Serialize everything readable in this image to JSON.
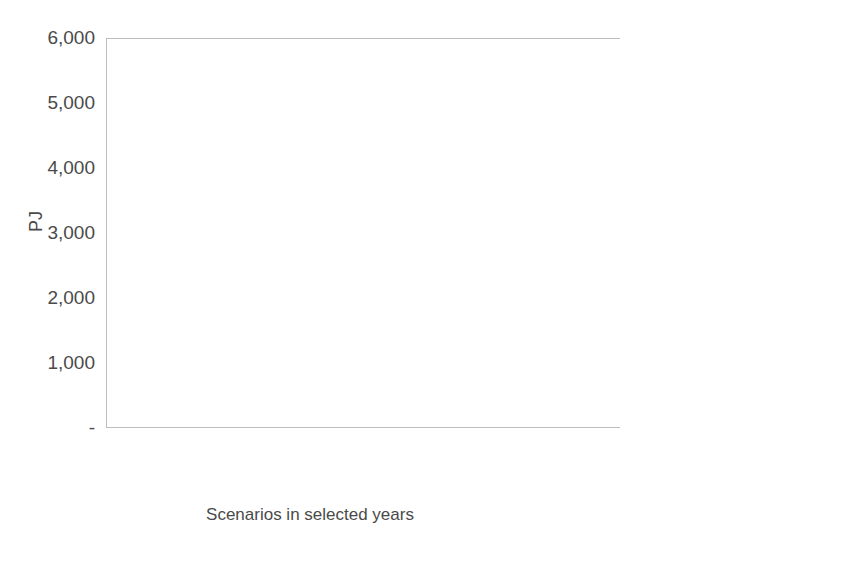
{
  "chart_data": {
    "type": "bar",
    "subtype": "stacked-vertical",
    "title": "",
    "xlabel": "Scenarios in selected years",
    "ylabel": "PJ",
    "ylim": [
      0,
      6000
    ],
    "ytick_values": [
      0,
      1000,
      2000,
      3000,
      4000,
      5000,
      6000
    ],
    "ytick_labels": [
      "-",
      "1,000",
      "2,000",
      "3,000",
      "4,000",
      "5,000",
      "6,000"
    ],
    "grid": false,
    "legend_position": "right",
    "categories": [
      "35-LC",
      "35-LC-EA",
      "35-LC-LC",
      "35-LC-SO",
      "50-LC",
      "50-LC-EA",
      "50-LC-LC",
      "50-LC-SO"
    ],
    "stack_order_bottom_to_top": [
      "Electricity",
      "Fuel oil",
      "LPG",
      "Gas",
      "Coal",
      "Petrol",
      "Diesel",
      "Jet fuel",
      "Hydrogen",
      "Ethanol/Methanol",
      "Bio diesels",
      "Manufactured fuel",
      "Biomass",
      "Heat",
      "Others"
    ],
    "series": [
      {
        "name": "Electricity",
        "values": [
          1240,
          1300,
          1260,
          1250,
          1610,
          1610,
          1820,
          1470
        ]
      },
      {
        "name": "Fuel oil",
        "values": [
          50,
          45,
          50,
          50,
          45,
          45,
          45,
          45
        ]
      },
      {
        "name": "LPG",
        "values": [
          15,
          15,
          15,
          15,
          15,
          15,
          15,
          15
        ]
      },
      {
        "name": "Gas",
        "values": [
          2200,
          1930,
          2000,
          2180,
          1200,
          1220,
          900,
          1400
        ]
      },
      {
        "name": "Coal",
        "values": [
          30,
          25,
          30,
          30,
          30,
          30,
          30,
          30
        ]
      },
      {
        "name": "Petrol",
        "values": [
          740,
          630,
          890,
          620,
          400,
          400,
          330,
          500
        ]
      },
      {
        "name": "Jet fuel",
        "values": [
          35,
          40,
          35,
          30,
          40,
          40,
          40,
          35
        ]
      },
      {
        "name": "Diesel",
        "values": [
          790,
          680,
          810,
          330,
          40,
          40,
          40,
          260
        ]
      },
      {
        "name": "Hydrogen",
        "values": [
          0,
          0,
          0,
          290,
          210,
          200,
          230,
          350
        ]
      },
      {
        "name": "Ethanol/Methanol",
        "values": [
          220,
          380,
          190,
          0,
          400,
          400,
          560,
          0
        ]
      },
      {
        "name": "Bio diesels",
        "values": [
          45,
          300,
          60,
          35,
          350,
          330,
          280,
          55
        ]
      },
      {
        "name": "Manufactured fuel",
        "values": [
          0,
          0,
          0,
          0,
          0,
          0,
          0,
          0
        ]
      },
      {
        "name": "Biomass",
        "values": [
          190,
          120,
          190,
          130,
          110,
          110,
          290,
          170
        ]
      },
      {
        "name": "Heat",
        "values": [
          20,
          20,
          20,
          20,
          20,
          20,
          20,
          20
        ]
      },
      {
        "name": "Others",
        "values": [
          10,
          10,
          10,
          10,
          10,
          10,
          10,
          10
        ]
      }
    ],
    "totals": [
      5585,
      5268,
      5525,
      4890,
      4370,
      4340,
      4380,
      4280
    ]
  },
  "axes": {
    "y_title": "PJ",
    "x_title": "Scenarios in selected years",
    "y_ticks": [
      "6,000",
      "5,000",
      "4,000",
      "3,000",
      "2,000",
      "1,000",
      "-"
    ],
    "x_ticks": [
      "35-LC",
      "35-LC-EA",
      "35-LC-LC",
      "35-LC-SO",
      "50-LC",
      "50-LC-EA",
      "50-LC-LC",
      "50-LC-SO"
    ]
  },
  "legend": {
    "items": [
      {
        "label": "Others",
        "pattern": "checker-light",
        "color": "#d9d9d9"
      },
      {
        "label": "Heat",
        "pattern": "solid-mid-grid",
        "color": "#a6a6a6"
      },
      {
        "label": "Biomass",
        "pattern": "brick",
        "color": "#e8e8e8"
      },
      {
        "label": "Manufactured fuel",
        "pattern": "plain-white",
        "color": "#ffffff"
      },
      {
        "label": "Bio diesels",
        "pattern": "horizontal",
        "color": "#ffffff"
      },
      {
        "label": "Ethanol/Methanol",
        "pattern": "plain-white",
        "color": "#ffffff"
      },
      {
        "label": "Hydrogen",
        "pattern": "vertical",
        "color": "#ffffff"
      },
      {
        "label": "Jet fuel",
        "pattern": "solid-black",
        "color": "#1a1a1a"
      },
      {
        "label": "Diesel",
        "pattern": "diagonal-down",
        "color": "#ffffff"
      },
      {
        "label": "Petrol",
        "pattern": "noise-light",
        "color": "#e4e4e4"
      },
      {
        "label": "Coal",
        "pattern": "speckle-pale",
        "color": "#efefef"
      },
      {
        "label": "Gas",
        "pattern": "noise-mid",
        "color": "#9d9d9d"
      },
      {
        "label": "LPG",
        "pattern": "cross-light",
        "color": "#f2f2f2"
      },
      {
        "label": "Fuel oil",
        "pattern": "diagonal-up",
        "color": "#ffffff"
      },
      {
        "label": "Electricity",
        "pattern": "noise-dark",
        "color": "#666666"
      }
    ]
  },
  "colors": {
    "electricity": "#666666",
    "gas": "#9d9d9d",
    "petrol": "#e4e4e4",
    "jet_fuel": "#1a1a1a",
    "axis": "#bdbdbd",
    "text": "#4a4a4a"
  }
}
